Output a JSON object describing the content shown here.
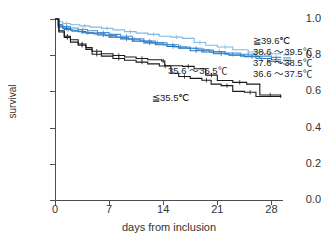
{
  "chart_data": {
    "type": "line",
    "title": "",
    "subtitle": "",
    "xlabel": "days from inclusion",
    "ylabel": "survival",
    "xlim": [
      0,
      29.5
    ],
    "ylim": [
      0.0,
      1.0
    ],
    "xticks": [
      0,
      7,
      14,
      21,
      28
    ],
    "xtick_labels": [
      "0",
      "7",
      "14",
      "21",
      "28"
    ],
    "yticks": [
      0.0,
      0.2,
      0.4,
      0.6,
      0.8,
      1.0
    ],
    "ytick_labels": [
      "0.0",
      "0.2",
      "0.4",
      "0.6",
      "0.8",
      "1.0"
    ],
    "grid": false,
    "legend_position": "right",
    "step_type": "post",
    "colors": {
      "light_blue": "#7FB9E6",
      "mid_blue": "#4A94D6",
      "deep_blue": "#1F6FB5",
      "steel_blue": "#3E86C8",
      "black": "#1a1a1a",
      "axis": "#4d4d4d"
    },
    "series": [
      {
        "name": "≧39.6℃",
        "color": "#7FB9E6",
        "legend_label": "≧39.6℃",
        "x": [
          0,
          0.4,
          1.0,
          2.0,
          3.2,
          4.5,
          6.0,
          7.5,
          9.0,
          10.5,
          12.0,
          13.5,
          15.0,
          16.5,
          18.0,
          19.5,
          21.0,
          23.0,
          25.0,
          27.0,
          29.2
        ],
        "y": [
          1.0,
          0.985,
          0.975,
          0.968,
          0.962,
          0.955,
          0.948,
          0.94,
          0.93,
          0.922,
          0.915,
          0.905,
          0.9,
          0.893,
          0.87,
          0.855,
          0.845,
          0.83,
          0.818,
          0.808,
          0.802
        ]
      },
      {
        "name": "38.6 ～39.5℃",
        "color": "#4A94D6",
        "legend_label": "38.6 ～39.5℃",
        "x": [
          0,
          0.4,
          1.0,
          2.0,
          3.0,
          4.2,
          5.5,
          7.0,
          8.5,
          10.0,
          11.5,
          13.0,
          14.5,
          16.0,
          17.5,
          19.0,
          20.5,
          22.0,
          24.0,
          26.0,
          28.0,
          29.2
        ],
        "y": [
          1.0,
          0.97,
          0.958,
          0.95,
          0.942,
          0.935,
          0.925,
          0.915,
          0.905,
          0.89,
          0.878,
          0.868,
          0.858,
          0.845,
          0.838,
          0.828,
          0.82,
          0.812,
          0.805,
          0.795,
          0.788,
          0.785
        ]
      },
      {
        "name": "37.6 ～38.5℃",
        "color": "#1F6FB5",
        "legend_label": "37.6 ～38.5℃",
        "x": [
          0,
          0.4,
          1.0,
          2.0,
          3.0,
          4.0,
          5.5,
          7.0,
          8.5,
          10.0,
          11.5,
          13.0,
          14.5,
          16.0,
          17.5,
          19.0,
          20.5,
          22.5,
          24.5,
          26.5,
          28.0,
          29.2
        ],
        "y": [
          1.0,
          0.962,
          0.948,
          0.938,
          0.93,
          0.922,
          0.912,
          0.9,
          0.89,
          0.878,
          0.868,
          0.858,
          0.848,
          0.838,
          0.825,
          0.818,
          0.808,
          0.8,
          0.792,
          0.782,
          0.775,
          0.772
        ]
      },
      {
        "name": "36.6 ～37.5℃",
        "color": "#3E86C8",
        "legend_label": "36.6 ～37.5℃",
        "x": [
          0,
          0.4,
          1.2,
          2.2,
          3.5,
          5.0,
          6.5,
          8.0,
          9.5,
          11.0,
          12.5,
          14.0,
          15.5,
          17.0,
          18.5,
          20.0,
          22.0,
          24.0,
          26.0,
          27.5,
          29.2
        ],
        "y": [
          1.0,
          0.955,
          0.942,
          0.932,
          0.925,
          0.918,
          0.908,
          0.898,
          0.888,
          0.878,
          0.868,
          0.858,
          0.845,
          0.838,
          0.828,
          0.818,
          0.805,
          0.795,
          0.782,
          0.765,
          0.752
        ]
      },
      {
        "name": "35.6 ～36.5℃",
        "color": "#1a1a1a",
        "annotation_label": "35.6 ～36.5℃",
        "x": [
          0,
          0.5,
          1.2,
          2.0,
          3.0,
          4.0,
          4.8,
          6.0,
          7.5,
          9.0,
          10.5,
          12.0,
          13.8,
          14.2,
          16.5,
          18.0,
          19.5,
          21.0,
          23.0,
          24.8,
          26.5,
          29.2
        ],
        "y": [
          1.0,
          0.935,
          0.905,
          0.885,
          0.862,
          0.842,
          0.822,
          0.808,
          0.798,
          0.79,
          0.782,
          0.775,
          0.768,
          0.742,
          0.738,
          0.725,
          0.69,
          0.66,
          0.65,
          0.64,
          0.58,
          0.572
        ]
      },
      {
        "name": "≦35.5℃",
        "color": "#1a1a1a",
        "annotation_label": "≦35.5℃",
        "x": [
          0,
          0.5,
          1.2,
          2.0,
          3.0,
          4.0,
          4.8,
          6.0,
          7.5,
          9.0,
          10.5,
          12.0,
          13.5,
          15.0,
          16.0,
          17.5,
          19.0,
          20.2,
          21.5,
          23.0,
          24.5,
          26.0,
          29.2
        ],
        "y": [
          1.0,
          0.928,
          0.898,
          0.872,
          0.855,
          0.832,
          0.805,
          0.795,
          0.782,
          0.772,
          0.762,
          0.752,
          0.74,
          0.7,
          0.682,
          0.672,
          0.662,
          0.64,
          0.632,
          0.6,
          0.595,
          0.572,
          0.565
        ]
      }
    ],
    "legend_entries": [
      "≧39.6℃",
      "38.6 ～39.5℃",
      "37.6 ～38.5℃",
      "36.6 ～37.5℃"
    ],
    "annotations": [
      {
        "text": "35.6 ～36.5℃",
        "x": 18.5,
        "y": 0.745
      },
      {
        "text": "≦35.5℃",
        "x": 16.2,
        "y": 0.595
      }
    ],
    "censor_marks": true
  }
}
